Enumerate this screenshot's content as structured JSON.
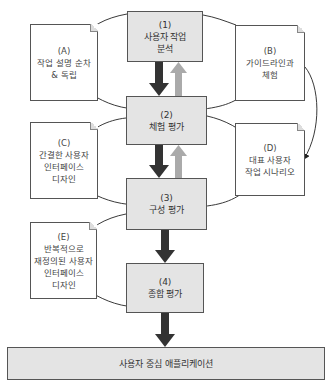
{
  "stages": [
    {
      "num": "(1)",
      "lines": [
        "사용자 작업",
        "분석"
      ]
    },
    {
      "num": "(2)",
      "lines": [
        "체험 평가"
      ]
    },
    {
      "num": "(3)",
      "lines": [
        "구성 평가"
      ]
    },
    {
      "num": "(4)",
      "lines": [
        "종합 평가"
      ]
    }
  ],
  "documents": [
    {
      "id": "(A)",
      "lines": [
        "작업 설명 순차",
        "& 독립"
      ]
    },
    {
      "id": "(B)",
      "lines": [
        "가이드라인과",
        "체험"
      ]
    },
    {
      "id": "(C)",
      "lines": [
        "간결한 사용자",
        "인터페이스",
        "디자인"
      ]
    },
    {
      "id": "(D)",
      "lines": [
        "대표 사용자",
        "작업 시나리오"
      ]
    },
    {
      "id": "(E)",
      "lines": [
        "반복적으로",
        "재정의된 사용자",
        "인터페이스",
        "디자인"
      ]
    }
  ],
  "output": {
    "label": "사용자 중심 애플리케이션"
  },
  "colors": {
    "stage_fill": "#e4e4e4",
    "forward_arrow": "#333333",
    "feedback_arrow": "#b0b0b0",
    "border": "#555555"
  }
}
